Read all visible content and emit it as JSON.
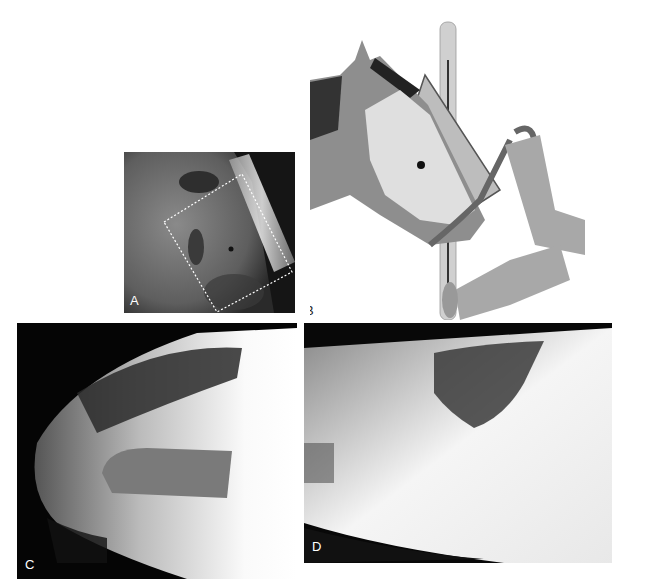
{
  "figure": {
    "panels": [
      {
        "id": "A",
        "label": "A",
        "description": "Photograph of horse head with radiographic cassette, dotted rectangle showing collimation field and centering dot"
      },
      {
        "id": "B",
        "label": "B",
        "description": "Illustration of horse head positioned against cassette holder with handler holding halter lead rope, skull anatomy overlay"
      },
      {
        "id": "C",
        "label": "C",
        "description": "Lateral radiograph of equine skull rostral region"
      },
      {
        "id": "D",
        "label": "D",
        "description": "Lateral radiograph of equine skull caudal/sinus region"
      }
    ]
  },
  "colors": {
    "background": "#ffffff",
    "radiograph_dark": "#080808",
    "label_light": "#ffffff",
    "label_dark": "#222222"
  }
}
